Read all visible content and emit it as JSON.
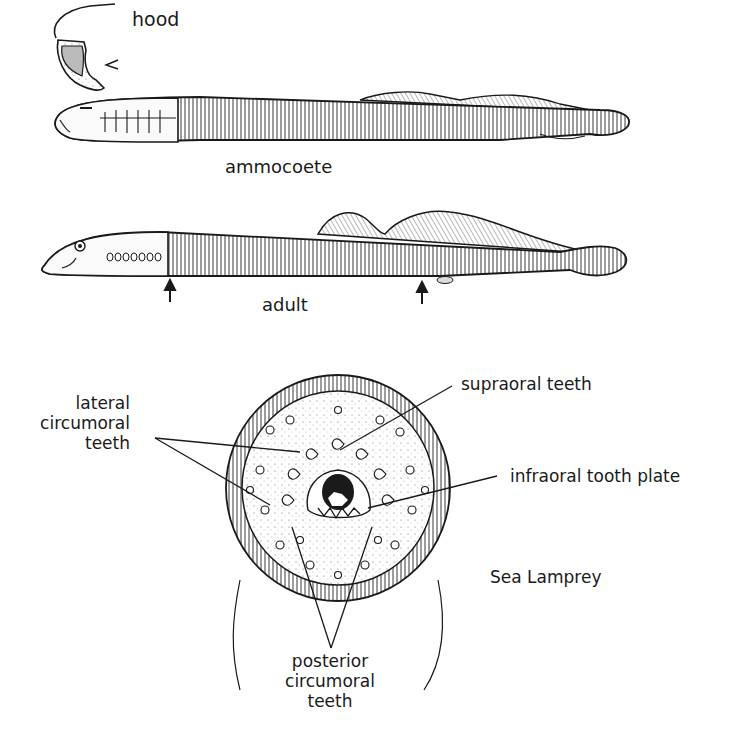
{
  "figure": {
    "title": "Sea Lamprey",
    "colors": {
      "ink": "#1a1a1a",
      "paper": "#ffffff",
      "stipple": "#555555"
    }
  },
  "panels": {
    "hood": {
      "label": "hood"
    },
    "ammocoete": {
      "label": "ammocoete"
    },
    "adult": {
      "label": "adult",
      "arrows": 2
    },
    "oral_disc": {
      "labels": {
        "lateral_line1": "lateral",
        "lateral_line2": "circumoral",
        "lateral_line3": "teeth",
        "supraoral": "supraoral teeth",
        "infraoral": "infraoral tooth plate",
        "posterior_line1": "posterior",
        "posterior_line2": "circumoral",
        "posterior_line3": "teeth"
      }
    }
  }
}
